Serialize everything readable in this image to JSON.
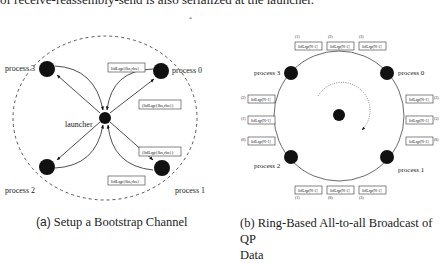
{
  "header_text": "of receive-reassembly-send is also serialized at the launcher.",
  "figure_a": {
    "caption_tag": "(a)",
    "caption": "Setup a Bootstrap Channel",
    "nodes": {
      "process3": "process 3",
      "process0": "process 0",
      "launcher": "launcher",
      "process2": "process 2",
      "process1": "process 1"
    },
    "messages": {
      "top_send": "lidLqp{lbs,rbs}",
      "top_recv": "(lidLqp{lbs,rbs})",
      "bottom_recv": "(lidLqp{lbs,rbs})",
      "bottom_send": "lidLqp{lbs,rbs}"
    }
  },
  "figure_b": {
    "caption_tag": "(b)",
    "caption_line1": "Ring-Based All-to-all Broadcast of QP",
    "caption_line2": "Data",
    "nodes": {
      "process3": "process 3",
      "process0": "process 0",
      "process2": "process 2",
      "process1": "process 1"
    },
    "message_label": "lidLqp[N-1]",
    "top_indices": [
      "(1)",
      "(2)",
      "(3)"
    ],
    "left_indices": [
      "(2)",
      "(1)",
      "(0)"
    ],
    "right_indices": [
      "(2)",
      "(3)",
      "(0)"
    ],
    "bottom_indices": [
      "(1)",
      "(0)",
      "(3)"
    ]
  }
}
